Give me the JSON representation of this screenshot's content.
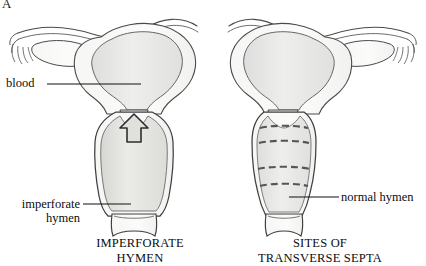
{
  "figure": {
    "panel_letter": "A",
    "background_color": "#ffffff",
    "outline_color": "#3a3a3a",
    "fill_light": "#f2f2f0",
    "fill_tissue": "#e8e8e6",
    "fill_blood": "#e2e2df",
    "dash_color": "#5a5a5a",
    "leader_color": "#1a1a1a"
  },
  "callouts": [
    {
      "id": "blood",
      "text": "blood"
    },
    {
      "id": "imperforate_hymen",
      "text": "imperforate\nhymen"
    },
    {
      "id": "normal_hymen",
      "text": "normal hymen"
    }
  ],
  "captions": [
    {
      "id": "left",
      "text": "IMPERFORATE\nHYMEN"
    },
    {
      "id": "right",
      "text": "SITES OF\nTRANSVERSE SEPTA"
    }
  ],
  "diagrams": {
    "left": {
      "name": "imperforate-hymen-diagram",
      "structures": [
        "uterus",
        "fallopian-tube",
        "fimbriae",
        "ovary",
        "cervix",
        "distended-vagina",
        "hematocolpos",
        "imperforate-hymen"
      ],
      "arrow": {
        "direction": "up",
        "meaning": "obstructed-blood-flow"
      }
    },
    "right": {
      "name": "transverse-septa-diagram",
      "structures": [
        "uterus",
        "fallopian-tube",
        "fimbriae",
        "ovary",
        "cervix",
        "vagina",
        "normal-hymen"
      ],
      "septa_count": 4,
      "septa_label": "dashed transverse septa sites"
    }
  }
}
